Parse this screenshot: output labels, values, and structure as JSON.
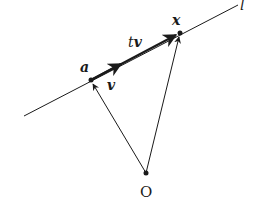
{
  "diagram": {
    "type": "vector-line-parametrization",
    "stroke_color": "#1a1a1a",
    "background": "#ffffff",
    "line": {
      "label": "l",
      "from": [
        24,
        116
      ],
      "to": [
        238,
        5
      ]
    },
    "points": [
      {
        "id": "a",
        "label": "a",
        "x": 91,
        "y": 80
      },
      {
        "id": "x",
        "label": "x",
        "x": 180,
        "y": 33
      },
      {
        "id": "O",
        "label": "O",
        "x": 146,
        "y": 173
      }
    ],
    "vectors": [
      {
        "id": "v",
        "label": "v",
        "from": "a",
        "to_xy": [
          121,
          64
        ],
        "style": "thick"
      },
      {
        "id": "tv",
        "label": "v",
        "label_prefix": "t",
        "from": "a",
        "to": "x",
        "style": "thick"
      },
      {
        "id": "Oa",
        "from": "O",
        "to": "a",
        "style": "thin"
      },
      {
        "id": "Ox",
        "from": "O",
        "to": "x",
        "style": "thin"
      }
    ]
  }
}
